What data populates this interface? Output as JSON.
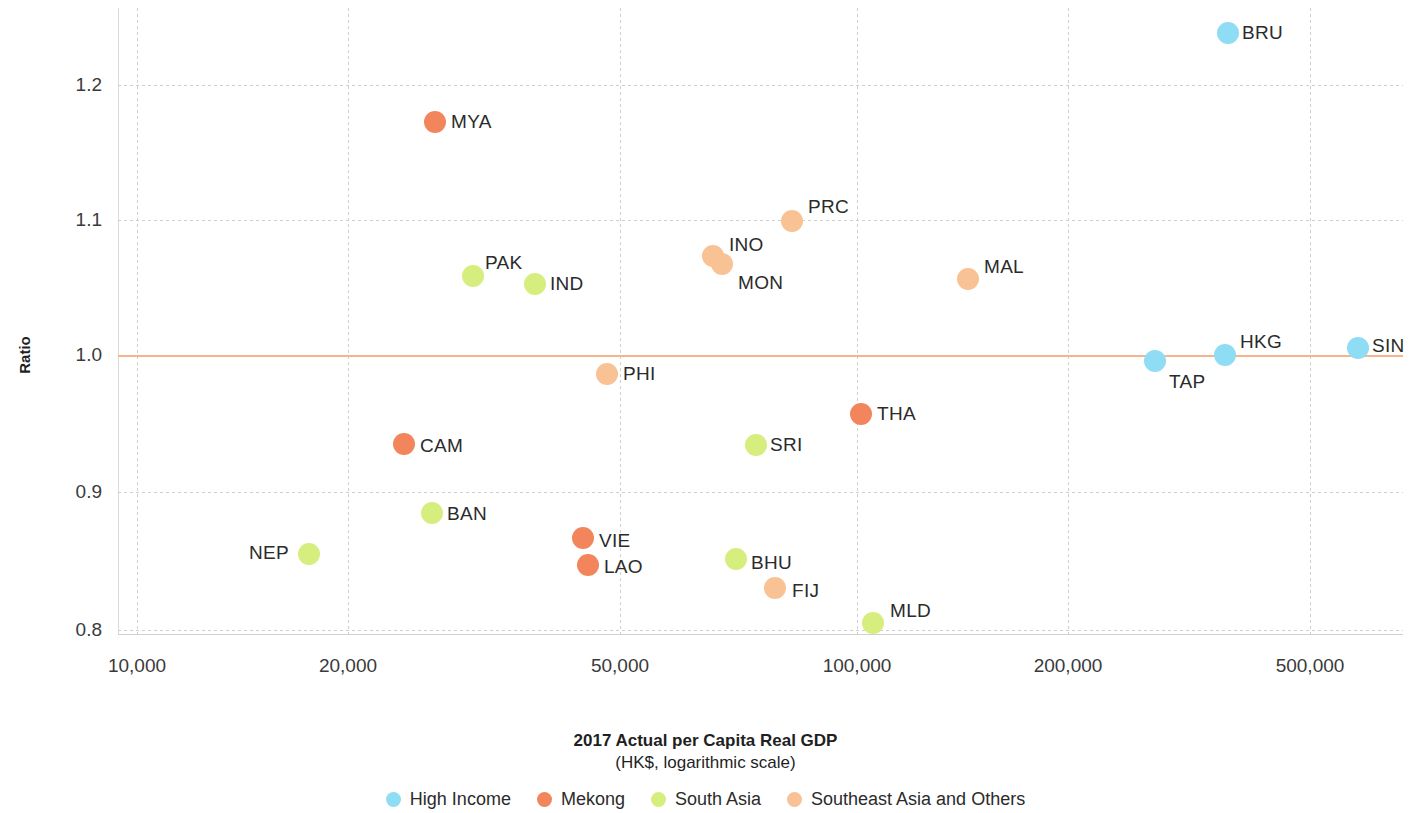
{
  "chart_data": {
    "type": "scatter",
    "title": "",
    "xlabel": "2017 Actual per Capita Real GDP",
    "xlabel_sub": "(HK$, logarithmic scale)",
    "ylabel": "Ratio",
    "x_scale": "log",
    "xlim": [
      8500,
      640000
    ],
    "ylim": [
      0.783,
      1.255
    ],
    "grid": true,
    "reference_line": {
      "y": 1.0,
      "color": "#f7b38a"
    },
    "xticks": [
      "10,000",
      "20,000",
      "50,000",
      "100,000",
      "200,000",
      "500,000"
    ],
    "xtick_values": [
      10000,
      20000,
      50000,
      100000,
      200000,
      500000
    ],
    "yticks": [
      "1.2",
      "1.1",
      "1.0",
      "0.9",
      "0.8"
    ],
    "ytick_values": [
      1.2,
      1.1,
      1.0,
      0.9,
      0.8
    ],
    "legend_position": "bottom",
    "series": [
      {
        "name": "High Income",
        "color": "#8fdcf5"
      },
      {
        "name": "Mekong",
        "color": "#f2855c"
      },
      {
        "name": "South Asia",
        "color": "#d6ee7e"
      },
      {
        "name": "Southeast Asia and Others",
        "color": "#f8c294"
      }
    ],
    "points": [
      {
        "label": "BRU",
        "group": "High Income",
        "color": "#8fdcf5",
        "x": 392000,
        "y": 1.237,
        "px": 1228,
        "py": 33,
        "lx": 14,
        "ly": 0
      },
      {
        "label": "MYA",
        "group": "Southeast Asia and Others",
        "color": "#f2855c",
        "x": 25500,
        "y": 1.174,
        "px": 435,
        "py": 122,
        "lx": 16,
        "ly": 0
      },
      {
        "label": "PRC",
        "group": "Southeast Asia and Others",
        "color": "#f8c294",
        "x": 87500,
        "y": 1.098,
        "px": 792,
        "py": 221,
        "lx": 16,
        "ly": -14
      },
      {
        "label": "INO",
        "group": "Southeast Asia and Others",
        "color": "#f8c294",
        "x": 69500,
        "y": 1.07,
        "px": 713,
        "py": 256,
        "lx": 16,
        "ly": -11
      },
      {
        "label": "MON",
        "group": "Southeast Asia and Others",
        "color": "#f8c294",
        "x": 72500,
        "y": 1.064,
        "px": 722,
        "py": 264,
        "lx": 16,
        "ly": 19
      },
      {
        "label": "PAK",
        "group": "South Asia",
        "color": "#d6ee7e",
        "x": 27500,
        "y": 1.059,
        "px": 473,
        "py": 276,
        "lx": 12,
        "ly": -13
      },
      {
        "label": "IND",
        "group": "South Asia",
        "color": "#d6ee7e",
        "x": 33500,
        "y": 1.054,
        "px": 535,
        "py": 284,
        "lx": 15,
        "ly": 0
      },
      {
        "label": "MAL",
        "group": "Southeast Asia and Others",
        "color": "#f8c294",
        "x": 163000,
        "y": 1.057,
        "px": 968,
        "py": 279,
        "lx": 16,
        "ly": -12
      },
      {
        "label": "HKG",
        "group": "High Income",
        "color": "#8fdcf5",
        "x": 382000,
        "y": 1.0,
        "px": 1225,
        "py": 355,
        "lx": 15,
        "ly": -13
      },
      {
        "label": "SIN",
        "group": "High Income",
        "color": "#8fdcf5",
        "x": 570000,
        "y": 1.005,
        "px": 1358,
        "py": 348,
        "lx": 14,
        "ly": -2
      },
      {
        "label": "TAP",
        "group": "High Income",
        "color": "#8fdcf5",
        "x": 272000,
        "y": 0.996,
        "px": 1155,
        "py": 361,
        "lx": 14,
        "ly": 21
      },
      {
        "label": "PHI",
        "group": "Southeast Asia and Others",
        "color": "#f8c294",
        "x": 46500,
        "y": 0.988,
        "px": 607,
        "py": 374,
        "lx": 16,
        "ly": 0
      },
      {
        "label": "THA",
        "group": "Mekong",
        "color": "#f2855c",
        "x": 105500,
        "y": 0.958,
        "px": 861,
        "py": 414,
        "lx": 16,
        "ly": 0
      },
      {
        "label": "SRI",
        "group": "South Asia",
        "color": "#d6ee7e",
        "x": 77500,
        "y": 0.936,
        "px": 756,
        "py": 445,
        "lx": 14,
        "ly": 0
      },
      {
        "label": "CAM",
        "group": "Mekong",
        "color": "#f2855c",
        "x": 22800,
        "y": 0.937,
        "px": 404,
        "py": 444,
        "lx": 16,
        "ly": 2
      },
      {
        "label": "BAN",
        "group": "South Asia",
        "color": "#d6ee7e",
        "x": 25500,
        "y": 0.886,
        "px": 432,
        "py": 513,
        "lx": 15,
        "ly": 1
      },
      {
        "label": "NEP",
        "group": "South Asia",
        "color": "#d6ee7e",
        "x": 17200,
        "y": 0.854,
        "px": 309,
        "py": 554,
        "lx": -60,
        "ly": -1
      },
      {
        "label": "VIE",
        "group": "Mekong",
        "color": "#f2855c",
        "x": 43200,
        "y": 0.865,
        "px": 583,
        "py": 538,
        "lx": 16,
        "ly": 3
      },
      {
        "label": "LAO",
        "group": "Mekong",
        "color": "#f2855c",
        "x": 43800,
        "y": 0.851,
        "px": 588,
        "py": 565,
        "lx": 16,
        "ly": 2
      },
      {
        "label": "BHU",
        "group": "South Asia",
        "color": "#d6ee7e",
        "x": 74500,
        "y": 0.851,
        "px": 736,
        "py": 559,
        "lx": 15,
        "ly": 4
      },
      {
        "label": "FIJ",
        "group": "Southeast Asia and Others",
        "color": "#f8c294",
        "x": 83500,
        "y": 0.828,
        "px": 775,
        "py": 588,
        "lx": 17,
        "ly": 3
      },
      {
        "label": "MLD",
        "group": "South Asia",
        "color": "#d6ee7e",
        "x": 111000,
        "y": 0.802,
        "px": 873,
        "py": 623,
        "lx": 17,
        "ly": -12
      }
    ]
  }
}
